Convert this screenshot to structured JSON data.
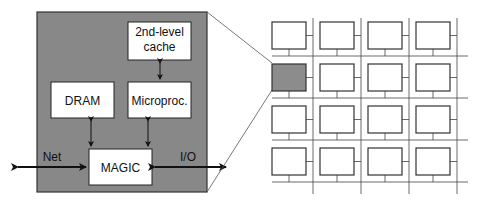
{
  "node": {
    "blocks": {
      "cache": [
        "2nd-level",
        "cache"
      ],
      "dram": "DRAM",
      "microproc": "Microproc.",
      "magic": "MAGIC"
    },
    "labels": {
      "net": "Net",
      "io": "I/O"
    }
  },
  "grid": {
    "rows": 4,
    "cols": 4,
    "highlighted": {
      "row": 1,
      "col": 0
    }
  },
  "colors": {
    "node_fill": "#888888",
    "highlight_fill": "#8c8c8c",
    "line": "#333333"
  }
}
